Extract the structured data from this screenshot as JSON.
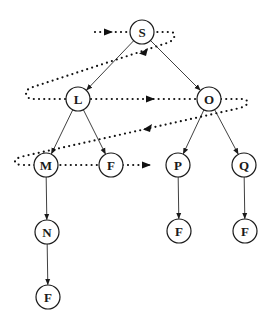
{
  "diagram": {
    "type": "tree-search-traversal",
    "colors": {
      "ink": "#1a1a1a",
      "background": "#ffffff"
    },
    "nodes": [
      {
        "id": "S",
        "label": "S",
        "x": 142,
        "y": 32
      },
      {
        "id": "L",
        "label": "L",
        "x": 78,
        "y": 99
      },
      {
        "id": "O",
        "label": "O",
        "x": 209,
        "y": 99
      },
      {
        "id": "M",
        "label": "M",
        "x": 46,
        "y": 165
      },
      {
        "id": "F1",
        "label": "F",
        "x": 111,
        "y": 165
      },
      {
        "id": "P",
        "label": "P",
        "x": 178,
        "y": 165
      },
      {
        "id": "Q",
        "label": "Q",
        "x": 244,
        "y": 165
      },
      {
        "id": "N",
        "label": "N",
        "x": 47,
        "y": 232
      },
      {
        "id": "F2",
        "label": "F",
        "x": 179,
        "y": 231
      },
      {
        "id": "F3",
        "label": "F",
        "x": 245,
        "y": 231
      },
      {
        "id": "F4",
        "label": "F",
        "x": 48,
        "y": 297
      }
    ],
    "edges": [
      {
        "from": "S",
        "to": "L"
      },
      {
        "from": "S",
        "to": "O"
      },
      {
        "from": "L",
        "to": "M"
      },
      {
        "from": "L",
        "to": "F1"
      },
      {
        "from": "O",
        "to": "P"
      },
      {
        "from": "O",
        "to": "Q"
      },
      {
        "from": "M",
        "to": "N"
      },
      {
        "from": "P",
        "to": "F2"
      },
      {
        "from": "Q",
        "to": "F3"
      },
      {
        "from": "N",
        "to": "F4"
      }
    ],
    "traversal_order": [
      "S",
      "L",
      "O",
      "M",
      "F",
      "P"
    ],
    "traversal_style": "dotted"
  }
}
